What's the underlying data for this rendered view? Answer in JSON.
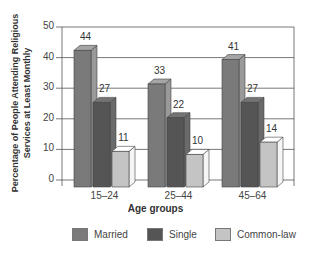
{
  "chart_data": {
    "type": "bar",
    "style": "3d-clustered",
    "title": "",
    "xlabel": "Age groups",
    "ylabel": "Percentage of People Attending Religious Services at Least Monthly",
    "ylabel_lines": [
      "Percentage of People Attending Religious",
      "Services at Least Monthly"
    ],
    "categories": [
      "15–24",
      "25–44",
      "45–64"
    ],
    "series": [
      {
        "name": "Married",
        "values": [
          44,
          33,
          41
        ],
        "color": "#7a7a7a"
      },
      {
        "name": "Single",
        "values": [
          27,
          22,
          27
        ],
        "color": "#555555"
      },
      {
        "name": "Common-law",
        "values": [
          11,
          10,
          14
        ],
        "color": "#c4c4c4"
      }
    ],
    "ylim": [
      0,
      50
    ],
    "yticks": [
      0,
      10,
      20,
      30,
      40,
      50
    ],
    "grid": true,
    "legend_position": "bottom",
    "data_labels": true
  }
}
